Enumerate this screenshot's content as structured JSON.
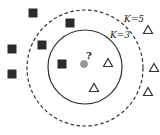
{
  "diagram": {
    "colors": {
      "square": "#2b2b2b",
      "query": "#9a9a9a",
      "triangle": "#333333",
      "circle": "#333333",
      "background": "#ffffff"
    },
    "labels": {
      "k5": "K=5",
      "k3": "K=3",
      "query": "?"
    },
    "circles": {
      "k3": {
        "cx": 85,
        "cy": 67,
        "r": 37,
        "style": "solid"
      },
      "k5": {
        "cx": 85,
        "cy": 68,
        "r": 58,
        "style": "dashed"
      }
    },
    "query_point": {
      "x": 84,
      "y": 64
    },
    "class_a_squares": [
      {
        "x": 33,
        "y": 13
      },
      {
        "x": 70,
        "y": 23
      },
      {
        "x": 42,
        "y": 45
      },
      {
        "x": 12,
        "y": 49
      },
      {
        "x": 12,
        "y": 74
      },
      {
        "x": 62,
        "y": 64
      }
    ],
    "class_b_triangles": [
      {
        "x": 108,
        "y": 63
      },
      {
        "x": 94,
        "y": 88
      },
      {
        "x": 148,
        "y": 30
      },
      {
        "x": 154,
        "y": 68
      },
      {
        "x": 148,
        "y": 92
      }
    ]
  }
}
